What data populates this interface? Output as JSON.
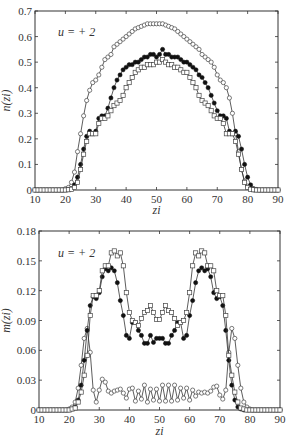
{
  "chart_data": [
    {
      "type": "line",
      "title": "",
      "annotation": "u = + 2",
      "xlabel": "z_i",
      "ylabel": "n(z_i)",
      "xlim": [
        10,
        90
      ],
      "ylim": [
        0,
        0.7
      ],
      "xticks": [
        10,
        20,
        30,
        40,
        50,
        60,
        70,
        80,
        90
      ],
      "xtick_labels": [
        "10",
        "20",
        "30",
        "40",
        "50",
        "60",
        "70",
        "80",
        "90"
      ],
      "yticks": [
        0,
        0.1,
        0.2,
        0.3,
        0.4,
        0.5,
        0.6,
        0.7
      ],
      "ytick_labels": [
        "0",
        "0.1",
        "0.2",
        "0.3",
        "0.4",
        "0.5",
        "0.6",
        "0.7"
      ],
      "grid": false,
      "legend": null,
      "x": [
        10,
        11,
        12,
        13,
        14,
        15,
        16,
        17,
        18,
        19,
        20,
        21,
        22,
        23,
        24,
        25,
        26,
        27,
        28,
        29,
        30,
        31,
        32,
        33,
        34,
        35,
        36,
        37,
        38,
        39,
        40,
        41,
        42,
        43,
        44,
        45,
        46,
        47,
        48,
        49,
        50,
        51,
        52,
        53,
        54,
        55,
        56,
        57,
        58,
        59,
        60,
        61,
        62,
        63,
        64,
        65,
        66,
        67,
        68,
        69,
        70,
        71,
        72,
        73,
        74,
        75,
        76,
        77,
        78,
        79,
        80,
        81,
        82,
        83,
        84,
        85,
        86,
        87,
        88,
        89,
        90
      ],
      "series": [
        {
          "name": "open circles",
          "marker": "circle-open",
          "values": [
            0,
            0,
            0,
            0,
            0,
            0,
            0,
            0,
            0,
            0,
            0.005,
            0.01,
            0.03,
            0.07,
            0.15,
            0.22,
            0.29,
            0.35,
            0.39,
            0.42,
            0.43,
            0.45,
            0.48,
            0.51,
            0.52,
            0.53,
            0.56,
            0.57,
            0.58,
            0.59,
            0.6,
            0.61,
            0.62,
            0.63,
            0.635,
            0.64,
            0.645,
            0.65,
            0.65,
            0.65,
            0.65,
            0.65,
            0.65,
            0.645,
            0.64,
            0.635,
            0.63,
            0.62,
            0.61,
            0.6,
            0.59,
            0.58,
            0.57,
            0.56,
            0.55,
            0.53,
            0.52,
            0.51,
            0.5,
            0.48,
            0.45,
            0.43,
            0.42,
            0.4,
            0.36,
            0.3,
            0.22,
            0.15,
            0.08,
            0.035,
            0.015,
            0.005,
            0,
            0,
            0,
            0,
            0,
            0,
            0,
            0,
            0
          ]
        },
        {
          "name": "filled circles",
          "marker": "circle-filled",
          "values": [
            0,
            0,
            0,
            0,
            0,
            0,
            0,
            0,
            0,
            0,
            0,
            0.002,
            0.005,
            0.02,
            0.05,
            0.1,
            0.16,
            0.21,
            0.23,
            0.22,
            0.23,
            0.28,
            0.29,
            0.29,
            0.32,
            0.36,
            0.4,
            0.43,
            0.45,
            0.47,
            0.48,
            0.49,
            0.49,
            0.5,
            0.5,
            0.51,
            0.52,
            0.52,
            0.53,
            0.53,
            0.52,
            0.53,
            0.55,
            0.53,
            0.53,
            0.52,
            0.52,
            0.52,
            0.51,
            0.5,
            0.5,
            0.49,
            0.48,
            0.47,
            0.45,
            0.44,
            0.42,
            0.4,
            0.37,
            0.34,
            0.31,
            0.29,
            0.29,
            0.28,
            0.23,
            0.22,
            0.23,
            0.21,
            0.16,
            0.1,
            0.05,
            0.02,
            0.005,
            0.002,
            0,
            0,
            0,
            0,
            0,
            0,
            0
          ]
        },
        {
          "name": "open squares",
          "marker": "square-open",
          "values": [
            0,
            0,
            0,
            0,
            0,
            0,
            0,
            0,
            0,
            0,
            0,
            0.001,
            0.003,
            0.01,
            0.03,
            0.08,
            0.14,
            0.19,
            0.22,
            0.22,
            0.22,
            0.26,
            0.28,
            0.28,
            0.29,
            0.31,
            0.33,
            0.34,
            0.35,
            0.37,
            0.4,
            0.42,
            0.44,
            0.46,
            0.47,
            0.48,
            0.48,
            0.49,
            0.49,
            0.49,
            0.5,
            0.5,
            0.51,
            0.5,
            0.49,
            0.49,
            0.48,
            0.48,
            0.47,
            0.46,
            0.46,
            0.44,
            0.42,
            0.4,
            0.37,
            0.35,
            0.34,
            0.33,
            0.31,
            0.29,
            0.28,
            0.28,
            0.26,
            0.22,
            0.22,
            0.22,
            0.19,
            0.14,
            0.08,
            0.03,
            0.01,
            0.003,
            0.001,
            0,
            0,
            0,
            0,
            0,
            0,
            0,
            0
          ]
        }
      ]
    },
    {
      "type": "line",
      "title": "",
      "annotation": "u = + 2",
      "xlabel": "z_i",
      "ylabel": "m(z_i)",
      "xlim": [
        10,
        90
      ],
      "ylim": [
        0,
        0.18
      ],
      "xticks": [
        10,
        20,
        30,
        40,
        50,
        60,
        70,
        80,
        90
      ],
      "xtick_labels": [
        "10",
        "20",
        "30",
        "40",
        "50",
        "60",
        "70",
        "80",
        "90"
      ],
      "yticks": [
        0,
        0.03,
        0.06,
        0.09,
        0.12,
        0.15,
        0.18
      ],
      "ytick_labels": [
        "0",
        "0.03",
        "0.06",
        "0.09",
        "0.12",
        "0.15",
        "0.18"
      ],
      "grid": false,
      "legend": null,
      "x": [
        10,
        11,
        12,
        13,
        14,
        15,
        16,
        17,
        18,
        19,
        20,
        21,
        22,
        23,
        24,
        25,
        26,
        27,
        28,
        29,
        30,
        31,
        32,
        33,
        34,
        35,
        36,
        37,
        38,
        39,
        40,
        41,
        42,
        43,
        44,
        45,
        46,
        47,
        48,
        49,
        50,
        51,
        52,
        53,
        54,
        55,
        56,
        57,
        58,
        59,
        60,
        61,
        62,
        63,
        64,
        65,
        66,
        67,
        68,
        69,
        70,
        71,
        72,
        73,
        74,
        75,
        76,
        77,
        78,
        79,
        80,
        81,
        82,
        83,
        84,
        85,
        86,
        87,
        88,
        89,
        90
      ],
      "series": [
        {
          "name": "open circles",
          "marker": "circle-open",
          "values": [
            0,
            0,
            0,
            0,
            0,
            0,
            0,
            0,
            0,
            0,
            0.001,
            0.003,
            0.008,
            0.022,
            0.045,
            0.072,
            0.082,
            0.058,
            0.02,
            0.008,
            0.02,
            0.031,
            0.028,
            0.019,
            0.017,
            0.019,
            0.02,
            0.021,
            0.017,
            0.012,
            0.021,
            0.022,
            0.009,
            0.019,
            0.011,
            0.025,
            0.008,
            0.021,
            0.01,
            0.021,
            0.009,
            0.025,
            0.009,
            0.025,
            0.009,
            0.025,
            0.01,
            0.022,
            0.012,
            0.022,
            0.01,
            0.02,
            0.014,
            0.018,
            0.017,
            0.018,
            0.017,
            0.019,
            0.023,
            0.024,
            0.015,
            0.011,
            0.02,
            0.058,
            0.082,
            0.072,
            0.045,
            0.022,
            0.008,
            0.003,
            0.001,
            0,
            0,
            0,
            0,
            0,
            0,
            0,
            0,
            0,
            0
          ]
        },
        {
          "name": "filled circles",
          "marker": "circle-filled",
          "values": [
            0,
            0,
            0,
            0,
            0,
            0,
            0,
            0,
            0,
            0,
            0,
            0.001,
            0.003,
            0.01,
            0.025,
            0.05,
            0.08,
            0.105,
            0.114,
            0.112,
            0.118,
            0.134,
            0.142,
            0.14,
            0.143,
            0.14,
            0.128,
            0.11,
            0.095,
            0.075,
            0.072,
            0.088,
            0.088,
            0.08,
            0.075,
            0.067,
            0.067,
            0.075,
            0.068,
            0.072,
            0.072,
            0.072,
            0.067,
            0.067,
            0.075,
            0.08,
            0.088,
            0.088,
            0.072,
            0.075,
            0.095,
            0.11,
            0.128,
            0.14,
            0.143,
            0.14,
            0.142,
            0.134,
            0.118,
            0.112,
            0.114,
            0.105,
            0.08,
            0.05,
            0.025,
            0.01,
            0.003,
            0.001,
            0,
            0,
            0,
            0,
            0,
            0,
            0,
            0,
            0,
            0,
            0,
            0,
            0
          ]
        },
        {
          "name": "open squares",
          "marker": "square-open",
          "values": [
            0,
            0,
            0,
            0,
            0,
            0,
            0,
            0,
            0,
            0,
            0,
            0.001,
            0.002,
            0.008,
            0.018,
            0.035,
            0.055,
            0.095,
            0.115,
            0.115,
            0.12,
            0.14,
            0.145,
            0.145,
            0.158,
            0.16,
            0.155,
            0.158,
            0.145,
            0.118,
            0.098,
            0.09,
            0.088,
            0.085,
            0.092,
            0.098,
            0.1,
            0.105,
            0.098,
            0.091,
            0.091,
            0.098,
            0.105,
            0.1,
            0.098,
            0.092,
            0.085,
            0.088,
            0.09,
            0.098,
            0.118,
            0.145,
            0.158,
            0.155,
            0.16,
            0.158,
            0.145,
            0.145,
            0.14,
            0.12,
            0.115,
            0.115,
            0.095,
            0.055,
            0.035,
            0.018,
            0.008,
            0.002,
            0.001,
            0,
            0,
            0,
            0,
            0,
            0,
            0,
            0,
            0,
            0,
            0,
            0
          ]
        }
      ]
    }
  ]
}
